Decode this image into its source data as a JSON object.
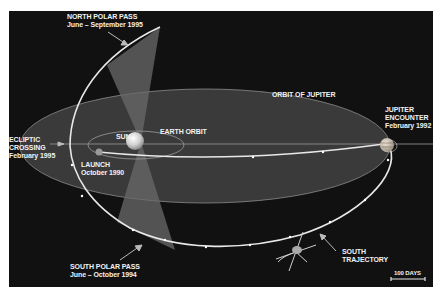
{
  "diagram": {
    "colors": {
      "background": "#111111",
      "jupiter_orbit_fill": "#3a3a3a",
      "trajectory": "#e8e8e8",
      "polar_cone": "#6a6a6a",
      "text": "#f2f2f2"
    },
    "labels": {
      "north_polar_pass": {
        "line1": "NORTH POLAR PASS",
        "line2": "June – September 1995"
      },
      "orbit_of_jupiter": "ORBIT OF JUPITER",
      "jupiter_encounter": {
        "line1": "JUPITER",
        "line2": "ENCOUNTER",
        "line3": "February 1992"
      },
      "ecliptic_crossing": {
        "line1": "ECLIPTIC",
        "line2": "CROSSING",
        "line3": "February 1995"
      },
      "sun": "SUN",
      "earth_orbit": "EARTH ORBIT",
      "launch": {
        "line1": "LAUNCH",
        "line2": "October 1990"
      },
      "south_polar_pass": {
        "line1": "SOUTH POLAR PASS",
        "line2": "June – October 1994"
      },
      "south_trajectory": {
        "line1": "SOUTH",
        "line2": "TRAJECTORY"
      },
      "scale_bar": "100 DAYS"
    },
    "icons": [
      "sun-icon",
      "jupiter-icon",
      "earth-icon",
      "spacecraft-icon",
      "arrow-icon"
    ]
  }
}
